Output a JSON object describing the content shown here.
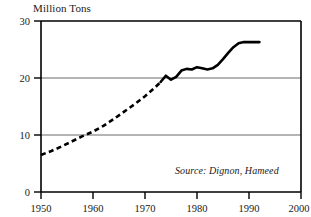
{
  "chart_data": {
    "type": "line",
    "title": "Million Tons",
    "xlabel": "",
    "ylabel": "",
    "ylim": [
      0,
      30
    ],
    "xlim": [
      1950,
      2000
    ],
    "grid": "horizontal gridlines at 10 and 20",
    "legend": "none",
    "annotations": [
      "Source: Dignon, Hameed"
    ],
    "y_ticks": [
      0,
      10,
      20,
      30
    ],
    "y_tick_labels": [
      "0",
      "10",
      "20",
      "30"
    ],
    "x_ticks": [
      1950,
      1960,
      1970,
      1980,
      1990,
      2000
    ],
    "x_tick_labels": [
      "1950",
      "1960",
      "1970",
      "1980",
      "1990",
      "2000"
    ],
    "series": [
      {
        "name": "estimated",
        "style": "dashed",
        "x": [
          1950,
          1952,
          1954,
          1956,
          1958,
          1960,
          1962,
          1964,
          1966,
          1968,
          1970,
          1972,
          1973
        ],
        "values": [
          6.5,
          7.2,
          8.0,
          8.9,
          9.8,
          10.6,
          11.6,
          12.8,
          14.1,
          15.4,
          16.8,
          18.4,
          19.3
        ]
      },
      {
        "name": "observed",
        "style": "solid",
        "x": [
          1973,
          1974,
          1975,
          1976,
          1977,
          1978,
          1979,
          1980,
          1981,
          1982,
          1983,
          1984,
          1985,
          1986,
          1987,
          1988,
          1989,
          1990,
          1991,
          1992
        ],
        "values": [
          19.3,
          20.4,
          19.7,
          20.2,
          21.3,
          21.6,
          21.5,
          21.9,
          21.7,
          21.5,
          21.7,
          22.3,
          23.3,
          24.4,
          25.4,
          26.1,
          26.3,
          26.3,
          26.3,
          26.3
        ]
      }
    ]
  },
  "title": {
    "text": "Million Tons"
  },
  "source": {
    "text": "Source: Dignon, Hameed"
  },
  "axis": {
    "y_labels": [
      "30",
      "20",
      "10",
      "0"
    ],
    "x_labels": [
      "1950",
      "1960",
      "1970",
      "1980",
      "1990",
      "2000"
    ]
  },
  "colors": {
    "line": "#000000",
    "axis": "#000000",
    "grid": "#6b6b6b",
    "background": "#ffffff"
  }
}
